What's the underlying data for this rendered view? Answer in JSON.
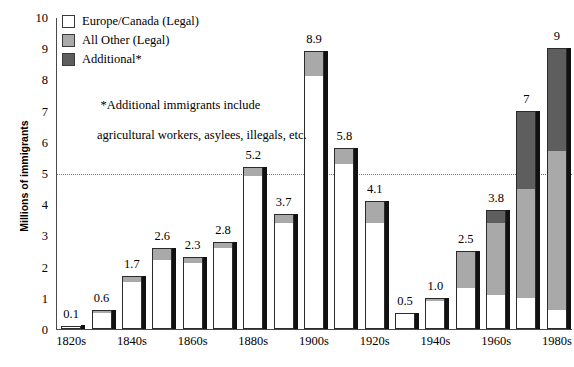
{
  "chart_data": {
    "type": "bar",
    "title": "",
    "subtitle": "",
    "xlabel": "",
    "ylabel": "Millions of immigrants",
    "ylim": [
      0,
      10
    ],
    "ytick_labels": [
      "0",
      "1",
      "2",
      "3",
      "4",
      "5",
      "6",
      "7",
      "8",
      "9",
      "10"
    ],
    "ytick_values": [
      0,
      1,
      2,
      3,
      4,
      5,
      6,
      7,
      8,
      9,
      10
    ],
    "grid": false,
    "reference_line": 5,
    "legend_position": "top-left",
    "stacked": true,
    "categories": [
      "1820s",
      "1830s",
      "1840s",
      "1850s",
      "1860s",
      "1870s",
      "1880s",
      "1890s",
      "1900s",
      "1910s",
      "1920s",
      "1930s",
      "1940s",
      "1950s",
      "1960s",
      "1970s",
      "1980s"
    ],
    "xtick_labels_shown": [
      "1820s",
      "1840s",
      "1860s",
      "1880s",
      "1900s",
      "1920s",
      "1940s",
      "1960s",
      "1980s"
    ],
    "series": [
      {
        "name": "Europe/Canada (Legal)",
        "color": "#ffffff",
        "values": [
          0.1,
          0.5,
          1.5,
          2.2,
          2.1,
          2.6,
          4.9,
          3.4,
          8.1,
          5.3,
          3.4,
          0.5,
          0.9,
          1.3,
          1.1,
          1.0,
          0.6
        ]
      },
      {
        "name": "All Other (Legal)",
        "color": "#a9a9a9",
        "values": [
          0.0,
          0.1,
          0.2,
          0.4,
          0.2,
          0.2,
          0.3,
          0.3,
          0.8,
          0.5,
          0.7,
          0.0,
          0.1,
          1.2,
          2.3,
          3.5,
          5.1
        ]
      },
      {
        "name": "Additional*",
        "color": "#5e5e5e",
        "values": [
          0,
          0,
          0,
          0,
          0,
          0,
          0,
          0,
          0,
          0,
          0,
          0,
          0,
          0,
          0.4,
          2.5,
          3.3
        ]
      }
    ],
    "totals": [
      0.1,
      0.6,
      1.7,
      2.6,
      2.3,
      2.8,
      5.2,
      3.7,
      8.9,
      5.8,
      4.1,
      0.5,
      1.0,
      2.5,
      3.8,
      7,
      9
    ],
    "value_labels": [
      "0.1",
      "0.6",
      "1.7",
      "2.6",
      "2.3",
      "2.8",
      "5.2",
      "3.7",
      "8.9",
      "5.8",
      "4.1",
      "0.5",
      "1.0",
      "2.5",
      "3.8",
      "7",
      "9"
    ]
  },
  "legend": {
    "items": [
      {
        "label": "Europe/Canada (Legal)",
        "key": "legal"
      },
      {
        "label": "All Other (Legal)",
        "key": "allother"
      },
      {
        "label": "Additional*",
        "key": "additional"
      }
    ],
    "note_line1": "*Additional immigrants include",
    "note_line2": "agricultural workers, asylees, illegals, etc."
  },
  "colors": {
    "legal": "#ffffff",
    "all_other": "#a9a9a9",
    "additional": "#5e5e5e",
    "axis": "#4a4a4a",
    "outline": "#2b2b2b",
    "reference_line": "#7b7b7b"
  }
}
